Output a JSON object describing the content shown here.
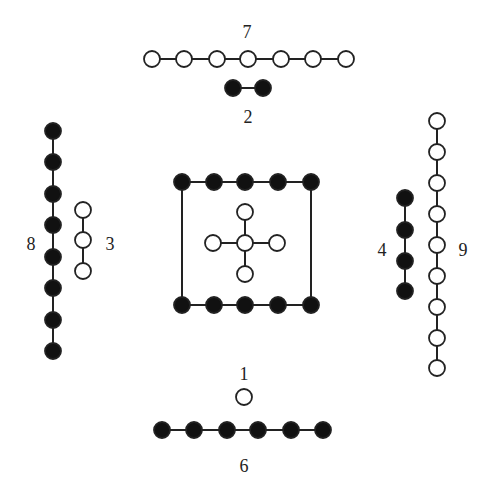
{
  "diagram": {
    "colors": {
      "filled": "#111111",
      "open": "#ffffff",
      "stroke": "#222222",
      "edge": "#222222"
    },
    "node_radius": 8,
    "labels": [
      {
        "text": "7",
        "x": 247,
        "y": 34
      },
      {
        "text": "2",
        "x": 248,
        "y": 119
      },
      {
        "text": "8",
        "x": 31,
        "y": 246
      },
      {
        "text": "3",
        "x": 110,
        "y": 246
      },
      {
        "text": "4",
        "x": 382,
        "y": 252
      },
      {
        "text": "9",
        "x": 463,
        "y": 252
      },
      {
        "text": "1",
        "x": 244,
        "y": 376
      },
      {
        "text": "6",
        "x": 244,
        "y": 468
      }
    ],
    "structures": [
      {
        "id": "7",
        "type": "open",
        "orientation": "horizontal",
        "nodes": [
          [
            152,
            59
          ],
          [
            184,
            59
          ],
          [
            217,
            59
          ],
          [
            248,
            59
          ],
          [
            281,
            59
          ],
          [
            313,
            59
          ],
          [
            346,
            59
          ]
        ]
      },
      {
        "id": "2",
        "type": "filled",
        "orientation": "horizontal",
        "nodes": [
          [
            233,
            88
          ],
          [
            263,
            88
          ]
        ]
      },
      {
        "id": "8",
        "type": "filled",
        "orientation": "vertical",
        "nodes": [
          [
            53,
            131
          ],
          [
            53,
            162
          ],
          [
            53,
            194
          ],
          [
            53,
            225
          ],
          [
            53,
            257
          ],
          [
            53,
            288
          ],
          [
            53,
            320
          ],
          [
            53,
            351
          ]
        ]
      },
      {
        "id": "3",
        "type": "open",
        "orientation": "vertical",
        "nodes": [
          [
            83,
            210
          ],
          [
            83,
            240
          ],
          [
            83,
            271
          ]
        ]
      },
      {
        "id": "4",
        "type": "filled",
        "orientation": "vertical",
        "nodes": [
          [
            405,
            198
          ],
          [
            405,
            230
          ],
          [
            405,
            261
          ],
          [
            405,
            291
          ]
        ]
      },
      {
        "id": "9",
        "type": "open",
        "orientation": "vertical",
        "nodes": [
          [
            437,
            121
          ],
          [
            437,
            152
          ],
          [
            437,
            183
          ],
          [
            437,
            214
          ],
          [
            437,
            245
          ],
          [
            437,
            276
          ],
          [
            437,
            307
          ],
          [
            437,
            338
          ],
          [
            437,
            368
          ]
        ]
      },
      {
        "id": "1",
        "type": "open",
        "orientation": "single",
        "nodes": [
          [
            244,
            397
          ]
        ]
      },
      {
        "id": "6",
        "type": "filled",
        "orientation": "horizontal",
        "nodes": [
          [
            162,
            430
          ],
          [
            194,
            430
          ],
          [
            227,
            430
          ],
          [
            258,
            430
          ],
          [
            291,
            430
          ],
          [
            323,
            430
          ]
        ]
      }
    ],
    "square": {
      "type": "filled",
      "top": [
        [
          182,
          182
        ],
        [
          214,
          182
        ],
        [
          245,
          182
        ],
        [
          278,
          182
        ],
        [
          311,
          182
        ]
      ],
      "bottom": [
        [
          182,
          305
        ],
        [
          214,
          305
        ],
        [
          245,
          305
        ],
        [
          278,
          305
        ],
        [
          311,
          305
        ]
      ],
      "sides": [
        [
          [
            182,
            182
          ],
          [
            182,
            305
          ]
        ],
        [
          [
            311,
            182
          ],
          [
            311,
            305
          ]
        ]
      ]
    },
    "cross": {
      "type": "open",
      "center": [
        245,
        243
      ],
      "arms": [
        [
          245,
          212
        ],
        [
          213,
          243
        ],
        [
          277,
          243
        ],
        [
          245,
          274
        ]
      ]
    }
  }
}
